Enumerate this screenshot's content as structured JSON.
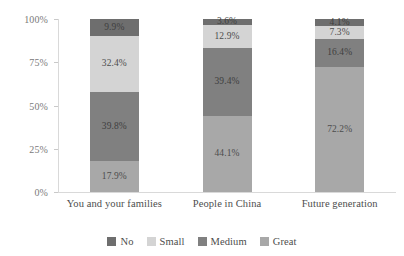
{
  "chart_data": {
    "type": "bar",
    "subtype": "stacked-100-percent",
    "title": "",
    "xlabel": "",
    "ylabel": "",
    "ylim": [
      0,
      100
    ],
    "y_ticks": [
      "0%",
      "25%",
      "50%",
      "75%",
      "100%"
    ],
    "grid": false,
    "legend_position": "bottom",
    "categories": [
      "You and your families",
      "People in China",
      "Future generation"
    ],
    "series": [
      {
        "name": "No",
        "color": "#6e6e6e",
        "values": [
          9.9,
          3.6,
          4.1
        ],
        "labels": [
          "9.9%",
          "3.6%",
          "4.1%"
        ]
      },
      {
        "name": "Small",
        "color": "#d4d4d4",
        "values": [
          32.4,
          12.9,
          7.3
        ],
        "labels": [
          "32.4%",
          "12.9%",
          "7.3%"
        ]
      },
      {
        "name": "Medium",
        "color": "#808080",
        "values": [
          39.8,
          39.4,
          16.4
        ],
        "labels": [
          "39.8%",
          "39.4%",
          "16.4%"
        ]
      },
      {
        "name": "Great",
        "color": "#a8a8a8",
        "values": [
          17.9,
          44.1,
          72.2
        ],
        "labels": [
          "17.9%",
          "44.1%",
          "72.2%"
        ]
      }
    ]
  },
  "axis": {
    "y_ticks": [
      {
        "label": "100%",
        "value": 100
      },
      {
        "label": "75%",
        "value": 75
      },
      {
        "label": "50%",
        "value": 50
      },
      {
        "label": "25%",
        "value": 25
      },
      {
        "label": "0%",
        "value": 0
      }
    ]
  },
  "legend": {
    "items": [
      {
        "label": "No",
        "color": "#6e6e6e"
      },
      {
        "label": "Small",
        "color": "#d4d4d4"
      },
      {
        "label": "Medium",
        "color": "#808080"
      },
      {
        "label": "Great",
        "color": "#a8a8a8"
      }
    ]
  },
  "colors": {
    "background": "#ffffff",
    "axis_line": "#d9d9d9",
    "tick_text": "#7a7a7a",
    "label_text": "#4d4d4d"
  }
}
